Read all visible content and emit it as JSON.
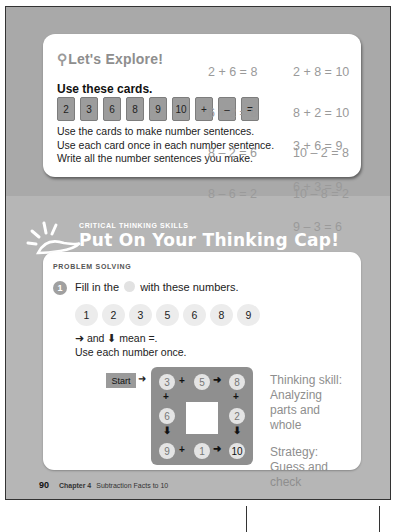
{
  "explore": {
    "title": "Let's Explore!",
    "subtitle": "Use these cards.",
    "cards": [
      "2",
      "3",
      "6",
      "8",
      "9",
      "10",
      "+",
      "–",
      "="
    ],
    "instructions": [
      "Use the cards to make number sentences.",
      "Use each card once in each number sentence.",
      "Write all the number sentences you make."
    ],
    "answers": {
      "col1": [
        "2 + 6 = 8",
        "6 + 2 = 8",
        "8 – 2 = 6",
        "8 – 6 = 2"
      ],
      "col2": [
        "2 + 8 = 10",
        "8 + 2 = 10",
        "10 – 2 = 8",
        "10 – 8 = 2"
      ],
      "col3": [
        "3 + 6 = 9",
        "6 + 3 = 9",
        "9 – 3 = 6",
        "9 – 6 = 3"
      ]
    }
  },
  "critical_thinking": {
    "kicker": "CRITICAL THINKING SKILLS",
    "title": "Put On Your Thinking Cap!"
  },
  "problem_solving": {
    "kicker": "PROBLEM SOLVING",
    "question_number": "1",
    "question_before": "Fill in the",
    "question_after": "with these numbers.",
    "numbers": [
      "1",
      "2",
      "3",
      "5",
      "6",
      "8",
      "9"
    ],
    "rule_line1": "➜ and ⬇ mean =.",
    "rule_line2": "Use each number once.",
    "puzzle": {
      "start_label": "Start",
      "top_row": [
        "3",
        "5",
        "8"
      ],
      "left_middle": "6",
      "right_middle": "2",
      "bottom_row": [
        "9",
        "1",
        "10"
      ]
    },
    "notes": {
      "skill_label": "Thinking skill:",
      "skill_value_1": "Analyzing",
      "skill_value_2": "parts and",
      "skill_value_3": "whole",
      "strategy_label": "Strategy:",
      "strategy_value_1": "Guess and",
      "strategy_value_2": "check"
    }
  },
  "footer": {
    "page_number": "90",
    "chapter": "Chapter 4",
    "chapter_title": "Subtraction Facts to 10"
  }
}
